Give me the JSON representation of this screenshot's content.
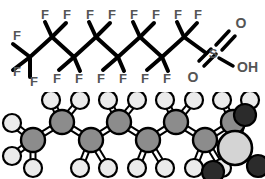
{
  "figure": {
    "panels": [
      {
        "id": "skeletal",
        "name": "skeletal-formula"
      },
      {
        "id": "model",
        "name": "ball-and-stick-model"
      }
    ]
  },
  "colors": {
    "background": "#ffffff",
    "bond": "#000000",
    "label_text": "#555555",
    "carbon": "#8c8c8c",
    "fluorine": "#ebebeb",
    "sulfur": "#d4d4d4",
    "oxygen": "#2b2b2b",
    "outline": "#000000"
  },
  "skeletal": {
    "labels_top": [
      {
        "text": "F",
        "x": 45,
        "y": 19
      },
      {
        "text": "F",
        "x": 67,
        "y": 19
      },
      {
        "text": "F",
        "x": 90,
        "y": 19
      },
      {
        "text": "F",
        "x": 112,
        "y": 19
      },
      {
        "text": "F",
        "x": 134,
        "y": 19
      },
      {
        "text": "F",
        "x": 156,
        "y": 19
      },
      {
        "text": "F",
        "x": 178,
        "y": 19
      },
      {
        "text": "F",
        "x": 198,
        "y": 19
      }
    ],
    "labels_left": [
      {
        "text": "F",
        "x": 17,
        "y": 39
      },
      {
        "text": "F",
        "x": 17,
        "y": 63
      }
    ],
    "labels_bottom": [
      {
        "text": "F",
        "x": 34,
        "y": 80
      },
      {
        "text": "F",
        "x": 57,
        "y": 80
      },
      {
        "text": "F",
        "x": 79,
        "y": 80
      },
      {
        "text": "F",
        "x": 101,
        "y": 80
      },
      {
        "text": "F",
        "x": 123,
        "y": 80
      },
      {
        "text": "F",
        "x": 145,
        "y": 80
      },
      {
        "text": "F",
        "x": 167,
        "y": 80
      }
    ],
    "sulfur_label": {
      "text": "S",
      "x": 213,
      "y": 55
    },
    "oxygen_top_label": {
      "text": "O",
      "x": 240,
      "y": 25
    },
    "oxygen_bottom_label": {
      "text": "O",
      "x": 193,
      "y": 78
    },
    "hydroxyl_label": {
      "text": "OH",
      "x": 240,
      "y": 70
    },
    "chain": {
      "vertices_up_y": 37,
      "vertices_down_y": 57,
      "x_positions": [
        30,
        52,
        74,
        96,
        118,
        140,
        162,
        184
      ]
    }
  },
  "model": {
    "carbon_count": 8,
    "fluorine_count": 17,
    "sulfur_count": 1,
    "oxygen_count": 3,
    "carbons": [
      {
        "x": 33,
        "y": 140,
        "r": 12
      },
      {
        "x": 62,
        "y": 122,
        "r": 12
      },
      {
        "x": 91,
        "y": 140,
        "r": 12
      },
      {
        "x": 119,
        "y": 122,
        "r": 12
      },
      {
        "x": 148,
        "y": 140,
        "r": 12
      },
      {
        "x": 176,
        "y": 122,
        "r": 12
      },
      {
        "x": 205,
        "y": 140,
        "r": 12
      },
      {
        "x": 233,
        "y": 122,
        "r": 12
      }
    ],
    "fluorines": [
      {
        "x": 12,
        "y": 123,
        "r": 9
      },
      {
        "x": 12,
        "y": 156,
        "r": 9
      },
      {
        "x": 33,
        "y": 168,
        "r": 9
      },
      {
        "x": 51,
        "y": 100,
        "r": 9
      },
      {
        "x": 80,
        "y": 100,
        "r": 9
      },
      {
        "x": 80,
        "y": 168,
        "r": 9
      },
      {
        "x": 108,
        "y": 168,
        "r": 9
      },
      {
        "x": 108,
        "y": 100,
        "r": 9
      },
      {
        "x": 137,
        "y": 100,
        "r": 9
      },
      {
        "x": 137,
        "y": 168,
        "r": 9
      },
      {
        "x": 165,
        "y": 168,
        "r": 9
      },
      {
        "x": 165,
        "y": 100,
        "r": 9
      },
      {
        "x": 194,
        "y": 100,
        "r": 9
      },
      {
        "x": 194,
        "y": 168,
        "r": 9
      },
      {
        "x": 222,
        "y": 168,
        "r": 9
      },
      {
        "x": 222,
        "y": 100,
        "r": 9
      },
      {
        "x": 250,
        "y": 100,
        "r": 9
      }
    ],
    "sulfur": {
      "x": 235,
      "y": 148,
      "r": 17
    },
    "oxygens": [
      {
        "x": 245,
        "y": 115,
        "r": 11
      },
      {
        "x": 258,
        "y": 166,
        "r": 11
      },
      {
        "x": 213,
        "y": 172,
        "r": 11
      }
    ]
  }
}
